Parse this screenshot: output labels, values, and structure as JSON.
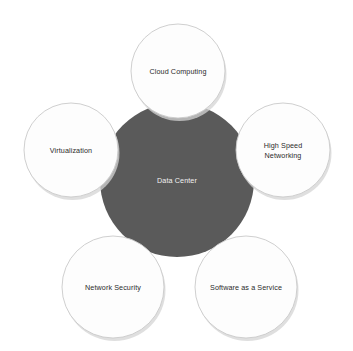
{
  "diagram": {
    "type": "hub-and-spoke",
    "hub": {
      "label": "Data Center",
      "fill_color": "#5a5a5a",
      "text_color": "#f2f2f2",
      "center": {
        "x": 177,
        "y": 180
      },
      "radius": 77
    },
    "background_color": "#ffffff",
    "node_fill_color": "#fdfdfd",
    "node_stroke_color": "#c9c9c9",
    "node_text_color": "#2b2b2b",
    "nodes": [
      {
        "name": "cloud-computing",
        "label": "Cloud Computing",
        "lines": [
          "Cloud Computing"
        ],
        "center": {
          "x": 178,
          "y": 71
        },
        "radius": 47
      },
      {
        "name": "high-speed-networking",
        "label": "High Speed Networking",
        "lines": [
          "High Speed",
          "Networking"
        ],
        "center": {
          "x": 283,
          "y": 150
        },
        "radius": 47
      },
      {
        "name": "software-as-a-service",
        "label": "Software as a Service",
        "lines": [
          "Software as a Service"
        ],
        "center": {
          "x": 246,
          "y": 287
        },
        "radius": 51
      },
      {
        "name": "network-security",
        "label": "Network Security",
        "lines": [
          "Network Security"
        ],
        "center": {
          "x": 113,
          "y": 287
        },
        "radius": 51
      },
      {
        "name": "virtualization",
        "label": "Virtualization",
        "lines": [
          "Virtualization"
        ],
        "center": {
          "x": 71,
          "y": 150
        },
        "radius": 47
      }
    ]
  }
}
